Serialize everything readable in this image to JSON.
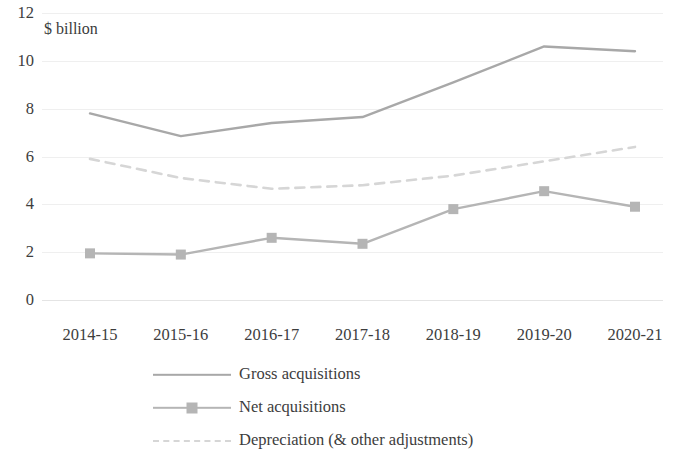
{
  "chart_data": {
    "type": "line",
    "title": "",
    "subtitle": "",
    "unit_label": "$ billion",
    "xlabel": "",
    "ylabel": "",
    "categories": [
      "2014-15",
      "2015-16",
      "2016-17",
      "2017-18",
      "2018-19",
      "2019-20",
      "2020-21"
    ],
    "ylim": [
      0,
      12
    ],
    "yticks": [
      0,
      2,
      4,
      6,
      8,
      10,
      12
    ],
    "ytick_labels": [
      "0",
      "2",
      "4",
      "6",
      "8",
      "10",
      "12"
    ],
    "grid": true,
    "grid_axis": "y",
    "legend_position": "bottom",
    "series": [
      {
        "name": "Gross acquisitions",
        "style": "solid",
        "marker": "none",
        "color": "#a8a8a8",
        "values": [
          7.8,
          6.85,
          7.4,
          7.65,
          9.1,
          10.6,
          10.4
        ]
      },
      {
        "name": "Net acquisitions",
        "style": "solid",
        "marker": "square",
        "color": "#b5b5b5",
        "values": [
          1.95,
          1.9,
          2.6,
          2.35,
          3.8,
          4.55,
          3.9
        ]
      },
      {
        "name": "Depreciation (& other adjustments)",
        "style": "dashed",
        "marker": "none",
        "color": "#d6d6d6",
        "values": [
          5.9,
          5.1,
          4.65,
          4.8,
          5.2,
          5.8,
          6.4
        ]
      }
    ]
  },
  "colors": {
    "background": "#ffffff",
    "gridline": "#efefef",
    "text": "#3d3d3d",
    "gross": "#a8a8a8",
    "net": "#b5b5b5",
    "depreciation": "#d6d6d6"
  }
}
